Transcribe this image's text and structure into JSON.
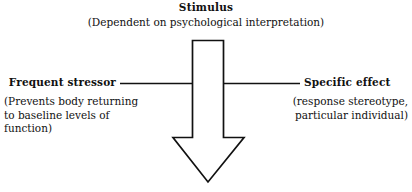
{
  "figure": {
    "background_color": "#ffffff",
    "stroke_color": "#111111",
    "text_color": "#111111"
  },
  "heading": {
    "title": "Stimulus",
    "subtitle": "(Dependent on psychological interpretation)"
  },
  "left": {
    "label": "Frequent stressor",
    "note_line1": "(Prevents body returning",
    "note_line2": "to baseline levels of function)"
  },
  "right": {
    "label": "Specific effect",
    "note_line1": "(response stereotype,",
    "note_line2": "particular individual)"
  },
  "graphics": {
    "arrow_icon": "down-arrow-outline",
    "arrow_direction": "down",
    "arrow_fill": "#ffffff",
    "arrow_stroke": "#111111",
    "connector_left_icon": "horizontal-line",
    "connector_right_icon": "horizontal-line"
  }
}
